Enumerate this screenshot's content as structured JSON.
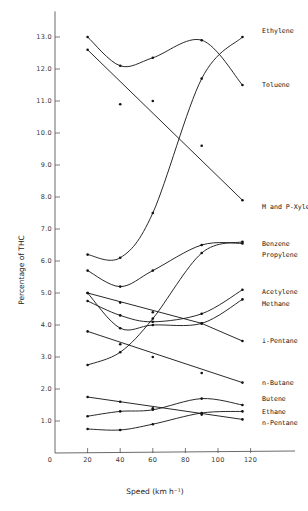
{
  "chart_data": {
    "type": "line",
    "title": "",
    "xlabel": "Speed (km h⁻¹)",
    "ylabel": "Percentage of THC",
    "xlim": [
      0,
      140
    ],
    "ylim": [
      0,
      13.5
    ],
    "x_ticks": [
      0,
      20,
      40,
      60,
      80,
      100,
      120
    ],
    "x_tick_labels": [
      "0",
      "20",
      "40",
      "60",
      "80",
      "100",
      "120"
    ],
    "y_ticks": [
      1,
      2,
      3,
      4,
      5,
      6,
      7,
      8,
      9,
      10,
      11,
      12,
      13
    ],
    "y_tick_labels": [
      "1.0",
      "2.0",
      "3.0",
      "4.0",
      "5.0",
      "6.0",
      "7.0",
      "8.0",
      "9.0",
      "10.0",
      "11.0",
      "12.0",
      "13.0"
    ],
    "grid": false,
    "legend_position": "inline-right",
    "series": [
      {
        "name": "Ethylene",
        "x": [
          20,
          40,
          60,
          90,
          115
        ],
        "values": [
          6.2,
          6.1,
          7.5,
          11.7,
          13.0
        ],
        "fit": "curve",
        "label_y": 13.2
      },
      {
        "name": "Toluene",
        "x": [
          20,
          40,
          60,
          90,
          115
        ],
        "values": [
          13.0,
          12.1,
          12.35,
          12.9,
          11.5
        ],
        "fit": "curve",
        "label_y": 11.5
      },
      {
        "name": "M and P-Xylene",
        "x": [
          20,
          40,
          60,
          90,
          115
        ],
        "values": [
          12.6,
          10.9,
          11.0,
          9.6,
          7.9
        ],
        "fit": "linear",
        "fit_line": [
          [
            20,
            12.6
          ],
          [
            115,
            7.9
          ]
        ],
        "label_y": 7.7
      },
      {
        "name": "Benzene",
        "x": [
          20,
          40,
          60,
          90,
          115
        ],
        "values": [
          5.7,
          5.2,
          5.7,
          6.5,
          6.55
        ],
        "fit": "curve",
        "label_y": 6.55
      },
      {
        "name": "Propylene",
        "x": [
          20,
          40,
          60,
          90,
          115
        ],
        "values": [
          2.75,
          3.15,
          4.2,
          6.25,
          6.6
        ],
        "fit": "curve",
        "label_y": 6.2
      },
      {
        "name": "Acetylene",
        "x": [
          20,
          40,
          60,
          90,
          115
        ],
        "values": [
          4.75,
          4.3,
          4.1,
          4.35,
          5.1
        ],
        "fit": "curve",
        "label_y": 5.05
      },
      {
        "name": "Methane",
        "x": [
          20,
          40,
          60,
          90,
          115
        ],
        "values": [
          5.0,
          3.9,
          4.0,
          4.05,
          4.8
        ],
        "fit": "curve",
        "label_y": 4.65
      },
      {
        "name": "i-Pentane",
        "x": [
          20,
          40,
          60,
          90,
          115
        ],
        "values": [
          5.0,
          4.7,
          4.4,
          4.05,
          3.5
        ],
        "fit": "linear",
        "fit_line": [
          [
            20,
            5.0
          ],
          [
            90,
            4.05
          ],
          [
            115,
            3.5
          ]
        ],
        "label_y": 3.5
      },
      {
        "name": "n-Butane",
        "x": [
          20,
          40,
          60,
          90,
          115
        ],
        "values": [
          3.8,
          3.4,
          3.0,
          2.5,
          2.2
        ],
        "fit": "linear",
        "fit_line": [
          [
            20,
            3.8
          ],
          [
            115,
            2.2
          ]
        ],
        "label_y": 2.2
      },
      {
        "name": "Butene",
        "x": [
          20,
          40,
          60,
          90,
          115
        ],
        "values": [
          1.15,
          1.3,
          1.35,
          1.7,
          1.5
        ],
        "fit": "curve",
        "label_y": 1.7
      },
      {
        "name": "Ethane",
        "x": [
          20,
          40,
          60,
          90,
          115
        ],
        "values": [
          0.75,
          0.72,
          0.9,
          1.25,
          1.3
        ],
        "fit": "curve",
        "label_y": 1.28
      },
      {
        "name": "n-Pentane",
        "x": [
          20,
          40,
          60,
          90,
          115
        ],
        "values": [
          1.75,
          1.6,
          1.4,
          1.2,
          1.05
        ],
        "fit": "linear",
        "fit_line": [
          [
            20,
            1.75
          ],
          [
            115,
            1.05
          ]
        ],
        "label_y": 0.95
      }
    ]
  }
}
